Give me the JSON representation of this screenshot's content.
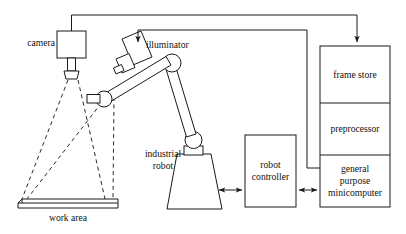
{
  "diagram": {
    "stroke_color": "#1a1a1a",
    "background_color": "#ffffff",
    "labels": {
      "camera": "camera",
      "illuminator": "illuminator",
      "industrial_robot_line1": "industrial",
      "industrial_robot_line2": "robot",
      "work_area": "work area",
      "robot_controller_line1": "robot",
      "robot_controller_line2": "controller",
      "frame_store": "frame store",
      "preprocessor": "preprocessor",
      "minicomputer_line1": "general",
      "minicomputer_line2": "purpose",
      "minicomputer_line3": "minicomputer"
    },
    "components": [
      {
        "id": "camera",
        "label": "camera",
        "shape": "box-with-lens"
      },
      {
        "id": "illuminator",
        "label": "illuminator",
        "shape": "tilted-box"
      },
      {
        "id": "industrial-robot",
        "label": "industrial robot",
        "shape": "articulated-arm"
      },
      {
        "id": "work-area",
        "label": "work area",
        "shape": "slab"
      },
      {
        "id": "robot-controller",
        "label": "robot controller",
        "shape": "box"
      },
      {
        "id": "frame-store",
        "label": "frame store",
        "shape": "box"
      },
      {
        "id": "preprocessor",
        "label": "preprocessor",
        "shape": "box"
      },
      {
        "id": "general-purpose-minicomputer",
        "label": "general purpose minicomputer",
        "shape": "box"
      }
    ],
    "connections": [
      {
        "from": "camera",
        "to": "frame-store",
        "style": "solid",
        "arrow": "single"
      },
      {
        "from": "general-purpose-minicomputer",
        "to": "illuminator",
        "style": "solid",
        "arrow": "single"
      },
      {
        "from": "industrial-robot",
        "to": "robot-controller",
        "style": "solid",
        "arrow": "double"
      },
      {
        "from": "robot-controller",
        "to": "general-purpose-minicomputer",
        "style": "solid",
        "arrow": "double"
      },
      {
        "from": "camera",
        "to": "work-area",
        "style": "dashed",
        "arrow": "none"
      },
      {
        "from": "illuminator",
        "to": "work-area",
        "style": "dashed",
        "arrow": "none"
      }
    ]
  }
}
